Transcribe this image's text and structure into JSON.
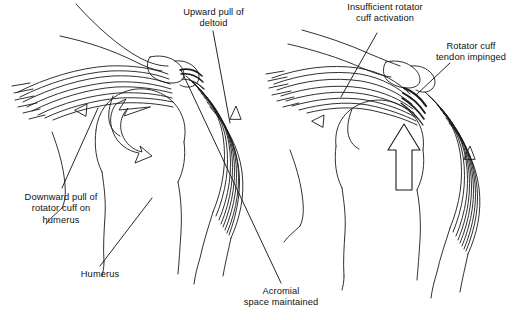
{
  "figure": {
    "background_color": "#ffffff",
    "ink_color": "#1a1a1a",
    "panels": [
      {
        "id": "left-panel",
        "name": "normal-shoulder-mechanics",
        "labels": [
          "Upward pull of\ndeltoid",
          "Downward pull of\nrotator cuff on\nhumerus",
          "Humerus",
          "Acromial\nspace maintained"
        ],
        "arrows": [
          "small-open-triangle-pointing-left-on-rotator-cuff",
          "large-curved-open-rotation-arrow-in-humeral-head",
          "small-open-triangle-pointing-up-on-deltoid"
        ]
      },
      {
        "id": "right-panel",
        "name": "impinged-shoulder-mechanics",
        "labels": [
          "Insufficient rotator\ncuff activation",
          "Rotator cuff\ntendon impinged"
        ],
        "arrows": [
          "small-open-triangle-pointing-left-on-rotator-cuff",
          "large-open-arrow-pointing-up-humeral-head-migration",
          "small-open-triangle-pointing-up-on-deltoid"
        ]
      }
    ]
  },
  "labels": {
    "upward_pull_of_deltoid": "Upward pull of\ndeltoid",
    "downward_pull_of_rotator_cuff": "Downward pull of\nrotator cuff on\nhumerus",
    "humerus": "Humerus",
    "acromial_space_maintained": "Acromial\nspace maintained",
    "insufficient_rotator_cuff_activation": "Insufficient rotator\ncuff activation",
    "rotator_cuff_tendon_impinged": "Rotator cuff\ntendon impinged"
  }
}
